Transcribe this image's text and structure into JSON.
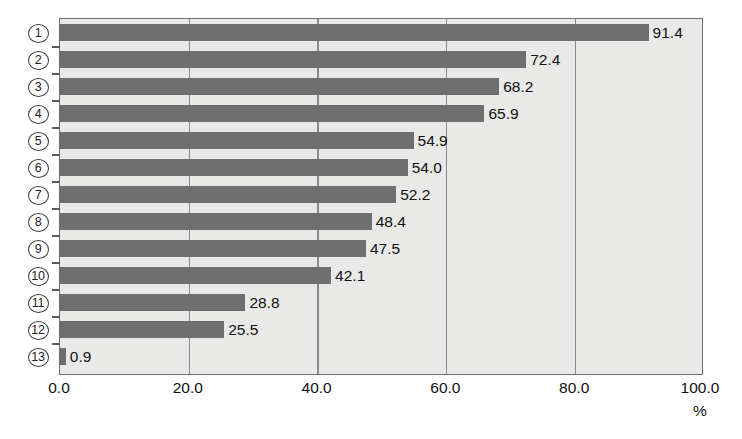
{
  "chart_data": {
    "type": "bar",
    "orientation": "horizontal",
    "title": "",
    "xlabel": "%",
    "ylabel": "",
    "xlim": [
      0,
      100
    ],
    "xticks": [
      "0.0",
      "20.0",
      "40.0",
      "60.0",
      "80.0",
      "100.0"
    ],
    "xtick_values": [
      0,
      20,
      40,
      60,
      80,
      100
    ],
    "grid": true,
    "legend": false,
    "categories": [
      "1",
      "2",
      "3",
      "4",
      "5",
      "6",
      "7",
      "8",
      "9",
      "10",
      "11",
      "12",
      "13"
    ],
    "category_style": "circled-number",
    "values": [
      91.4,
      72.4,
      68.2,
      65.9,
      54.9,
      54.0,
      52.2,
      48.4,
      47.5,
      42.1,
      28.8,
      25.5,
      0.9
    ],
    "data_labels": [
      "91.4",
      "72.4",
      "68.2",
      "65.9",
      "54.9",
      "54.0",
      "52.2",
      "48.4",
      "47.5",
      "42.1",
      "28.8",
      "25.5",
      "0.9"
    ],
    "colors": {
      "bar": "#6f6f6f",
      "plot_background": "#e9e9e7",
      "page_background": "#ffffff",
      "gridline": "#8a8a8a",
      "axis": "#6d6d6d",
      "text": "#111111"
    }
  }
}
